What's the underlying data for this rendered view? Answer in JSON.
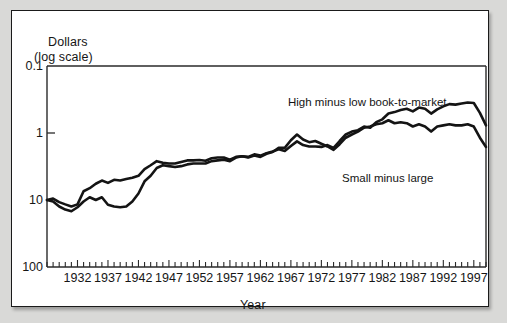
{
  "figure": {
    "background_color": "#d9d9d7",
    "panel_color": "#ffffff",
    "line_color": "#141414"
  },
  "axes": {
    "ylabel_line1": "Dollars",
    "ylabel_line2": "(log scale)",
    "xlabel": "Year",
    "ytick_labels": [
      "100",
      "10",
      "1",
      "0.1"
    ],
    "xtick_labels": [
      "1932",
      "1937",
      "1942",
      "1947",
      "1952",
      "1957",
      "1962",
      "1967",
      "1972",
      "1977",
      "1982",
      "1987",
      "1992",
      "1997"
    ]
  },
  "series_labels": {
    "high_minus_low": "High minus low book-to-market",
    "small_minus_large": "Small minus large"
  },
  "chart_data": {
    "type": "line",
    "title": "",
    "subtitle": "",
    "xlabel": "Year",
    "ylabel": "Dollars (log scale)",
    "yscale": "log",
    "ylim": [
      0.1,
      100
    ],
    "xlim": [
      1927,
      1999
    ],
    "grid": false,
    "legend": "inline-annotations",
    "ytick_values": [
      0.1,
      1,
      10,
      100
    ],
    "xtick_values": [
      1932,
      1937,
      1942,
      1947,
      1952,
      1957,
      1962,
      1967,
      1972,
      1977,
      1982,
      1987,
      1992,
      1997
    ],
    "minor_xticks": "every year 1927-1999",
    "x": [
      1927,
      1928,
      1929,
      1930,
      1931,
      1932,
      1933,
      1934,
      1935,
      1936,
      1937,
      1938,
      1939,
      1940,
      1941,
      1942,
      1943,
      1944,
      1945,
      1946,
      1947,
      1948,
      1949,
      1950,
      1951,
      1952,
      1953,
      1954,
      1955,
      1956,
      1957,
      1958,
      1959,
      1960,
      1961,
      1962,
      1963,
      1964,
      1965,
      1966,
      1967,
      1968,
      1969,
      1970,
      1971,
      1972,
      1973,
      1974,
      1975,
      1976,
      1977,
      1978,
      1979,
      1980,
      1981,
      1982,
      1983,
      1984,
      1985,
      1986,
      1987,
      1988,
      1989,
      1990,
      1991,
      1992,
      1993,
      1994,
      1995,
      1996,
      1997,
      1998,
      1999
    ],
    "series": [
      {
        "name": "High minus low book-to-market",
        "values": [
          1.0,
          1.05,
          0.93,
          0.86,
          0.8,
          0.86,
          1.35,
          1.5,
          1.75,
          1.95,
          1.8,
          2.0,
          1.95,
          2.05,
          2.15,
          2.3,
          2.9,
          3.3,
          3.8,
          3.6,
          3.5,
          3.5,
          3.7,
          3.9,
          3.9,
          3.95,
          3.85,
          4.2,
          4.3,
          4.3,
          4.0,
          4.4,
          4.5,
          4.4,
          4.8,
          4.6,
          5.0,
          5.3,
          5.7,
          5.4,
          6.4,
          7.5,
          6.6,
          6.3,
          6.3,
          6.2,
          6.6,
          6.0,
          7.6,
          9.5,
          10.5,
          11.0,
          12.5,
          12.0,
          14.5,
          16.0,
          19.5,
          20.5,
          22.0,
          23.0,
          21.0,
          24.0,
          23.0,
          19.5,
          22.5,
          25.0,
          27.0,
          26.5,
          27.5,
          28.5,
          28.0,
          20.0,
          13.0
        ]
      },
      {
        "name": "Small minus large",
        "values": [
          1.0,
          0.95,
          0.8,
          0.72,
          0.68,
          0.78,
          0.95,
          1.1,
          1.0,
          1.1,
          0.85,
          0.8,
          0.78,
          0.8,
          0.95,
          1.25,
          1.9,
          2.3,
          3.0,
          3.3,
          3.2,
          3.1,
          3.2,
          3.4,
          3.5,
          3.5,
          3.5,
          3.8,
          3.9,
          4.0,
          3.8,
          4.3,
          4.5,
          4.3,
          4.6,
          4.4,
          4.9,
          5.2,
          6.0,
          6.0,
          7.8,
          9.5,
          8.0,
          7.3,
          7.6,
          6.9,
          6.3,
          5.6,
          6.8,
          8.5,
          9.5,
          10.5,
          12.0,
          12.5,
          13.5,
          14.0,
          15.5,
          14.0,
          14.5,
          14.0,
          12.5,
          13.5,
          12.5,
          10.5,
          12.5,
          13.0,
          13.5,
          13.0,
          13.0,
          13.5,
          12.5,
          8.5,
          6.2
        ]
      }
    ]
  }
}
